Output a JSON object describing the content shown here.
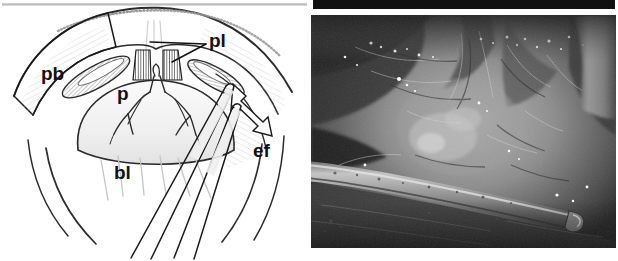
{
  "figure": {
    "panel_count": 2,
    "background_color": "#ffffff"
  },
  "left_panel": {
    "name": "schematic-line-drawing",
    "description": "Pen-and-ink schematic of the operative field showing a dome-shaped structure retracted by two fine forceps, with a hollow outline arrow indicating the direction of dissection.",
    "style": "black ink line drawing with grey hatching on white",
    "labels": [
      {
        "id": "pb",
        "text": "pb",
        "color": "#111111",
        "x": 41,
        "y": 64,
        "anchor": "left-wall"
      },
      {
        "id": "pl",
        "text": "pl",
        "color": "#111111",
        "x": 209,
        "y": 31,
        "anchor": "striated-bands-top-centre",
        "leader_line": true
      },
      {
        "id": "p",
        "text": "p",
        "color": "#111111",
        "x": 117,
        "y": 84,
        "anchor": "central-branching-structure"
      },
      {
        "id": "bl",
        "text": "bl",
        "color": "#111111",
        "x": 114,
        "y": 163,
        "anchor": "lower-field"
      },
      {
        "id": "ef",
        "text": "ef",
        "color": "#111111",
        "x": 253,
        "y": 141,
        "anchor": "right-flap"
      }
    ],
    "elements": {
      "dome_outline": "outer arch spanning the upper field",
      "striated_bands": 2,
      "hatched_ellipses": 2,
      "branching_vessel": "Y-shaped central branching structure with fine side branches",
      "instruments": "two long fine forceps tips converging at upper right",
      "hollow_arrow": "outlined arrow pointing down and to the right toward 'ef'"
    },
    "top_rule_color": "#c8c8c8"
  },
  "right_panel": {
    "name": "intraoperative-photograph",
    "description": "Grayscale intraoperative photograph of the same anatomy; a metal retractor shaft crosses the lower third of the field from left to right.",
    "style": "black and white photograph",
    "top_bar_color": "#111111",
    "labels": [
      {
        "id": "la",
        "text": "la",
        "color": "#ffffff",
        "x": 341,
        "y": 124,
        "anchor": "left-structure"
      },
      {
        "id": "P",
        "text": "P",
        "color": "#111111",
        "x": 494,
        "y": 116,
        "anchor": "central-structure"
      }
    ],
    "elements": {
      "retractor_shaft": "bright tubular instrument crossing lower field diagonally",
      "tissue_planes": "dissected tissue planes with specular highlights",
      "vertical_structure_right": "pale vertical band at right margin"
    }
  }
}
